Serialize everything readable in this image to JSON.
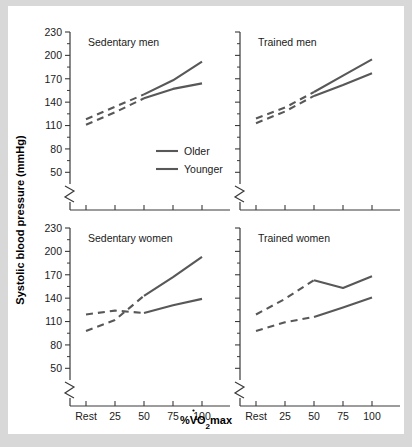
{
  "figure": {
    "background": "#ffffff",
    "page_background": "#d8d8d8",
    "line_color": "#585858",
    "axis_color": "#3a3a3a"
  },
  "axis_titles": {
    "y": "Systolic blood pressure (mmHg)",
    "x_prefix": "%V",
    "x_sub": "O",
    "x_sub2": "2",
    "x_suffix": "max",
    "x_full": "%VO2max"
  },
  "legend": {
    "position": "top-left-panel",
    "entries": [
      {
        "label": "Older",
        "color": "#585858"
      },
      {
        "label": "Younger",
        "color": "#585858"
      }
    ]
  },
  "chart_data": {
    "type": "line",
    "title": "",
    "xlabel": "%VO2max",
    "ylabel": "Systolic blood pressure (mmHg)",
    "grid": false,
    "legend_position": "inside top-left panel",
    "ylim": [
      35,
      230
    ],
    "y_ticks": [
      50,
      80,
      110,
      140,
      170,
      200,
      230
    ],
    "y_axis_break": true,
    "y_axis_break_below": 50,
    "x": [
      "Rest",
      25,
      50,
      75,
      100
    ],
    "x_ticks": [
      "Rest",
      "25",
      "50",
      "75",
      "100"
    ],
    "panels": [
      {
        "id": "sedentary-men",
        "title": "Sedentary men",
        "row": 0,
        "col": 0,
        "series": [
          {
            "name": "Older",
            "values": [
              118,
              134,
              150,
              168,
              192
            ],
            "dashed_until_x": 50,
            "note": "upper curve; dashed Rest-50, solid 50-100"
          },
          {
            "name": "Younger",
            "values": [
              111,
              127,
              145,
              157,
              164
            ],
            "dashed_until_x": 50,
            "note": "lower curve; dashed Rest-50, solid 50-100"
          }
        ]
      },
      {
        "id": "trained-men",
        "title": "Trained men",
        "row": 0,
        "col": 1,
        "series": [
          {
            "name": "Older",
            "values": [
              119,
              133,
              153,
              174,
              195
            ],
            "dashed_until_x": 50,
            "note": "upper curve; dashed Rest-50, solid 50-100"
          },
          {
            "name": "Younger",
            "values": [
              113,
              128,
              148,
              162,
              177
            ],
            "dashed_until_x": 50,
            "note": "lower curve; dashed Rest-50, solid 50-100"
          }
        ]
      },
      {
        "id": "sedentary-women",
        "title": "Sedentary women",
        "row": 1,
        "col": 0,
        "series": [
          {
            "name": "Older",
            "values": [
              98,
              112,
              143,
              167,
              193
            ],
            "dashed_until_x": 50,
            "note": "starts lower, crosses Younger, ends highest"
          },
          {
            "name": "Younger",
            "values": [
              119,
              124,
              121,
              131,
              139
            ],
            "dashed_until_x": 50,
            "note": "starts higher, crosses Older, ends lower"
          }
        ]
      },
      {
        "id": "trained-women",
        "title": "Trained women",
        "row": 1,
        "col": 1,
        "series": [
          {
            "name": "Older",
            "values": [
              119,
              139,
              163,
              153,
              168
            ],
            "dashed_until_x": 50,
            "note": "dips between 50 and 75"
          },
          {
            "name": "Younger",
            "values": [
              98,
              109,
              116,
              128,
              141
            ],
            "dashed_until_x": 50,
            "note": "lower curve throughout"
          }
        ]
      }
    ]
  }
}
